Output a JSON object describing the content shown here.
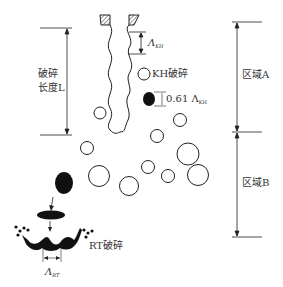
{
  "labels": {
    "breakup_length_line1": "破碎",
    "breakup_length_line2": "长度L",
    "lambda_kh": "Λ",
    "lambda_kh_sub": "KH",
    "kh_breakup": "KH破碎",
    "scale_factor": "0.61 Λ",
    "scale_factor_sub": "KH",
    "region_a": "区域A",
    "region_b": "区域B",
    "rt_breakup": "RT破碎",
    "lambda_rt": "Λ",
    "lambda_rt_sub": "RT"
  },
  "colors": {
    "stroke": "#222222",
    "fill_dark": "#111111",
    "text": "#333333"
  }
}
